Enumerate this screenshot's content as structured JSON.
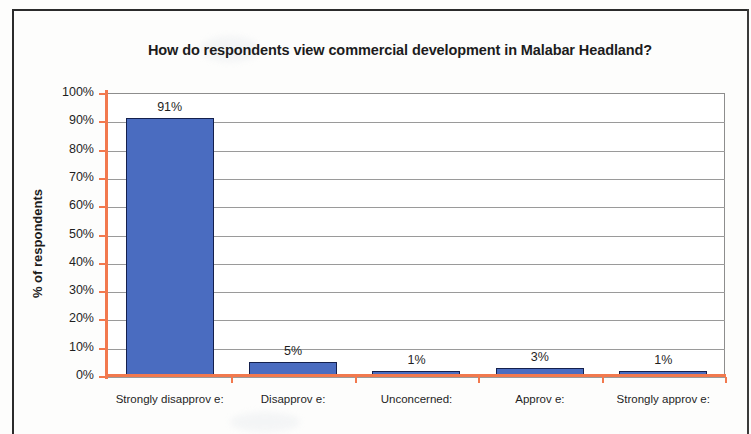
{
  "chart_data": {
    "type": "bar",
    "title": "How do respondents view commercial development in Malabar Headland?",
    "xlabel": "",
    "ylabel": "% of respondents",
    "categories": [
      "Strongly  disapprov e:",
      "Disapprov e:",
      "Unconcerned:",
      "Approv e:",
      "Strongly  approv e:"
    ],
    "values": [
      91,
      5,
      1,
      3,
      1
    ],
    "value_labels": [
      "91%",
      "5%",
      "1%",
      "3%",
      "1%"
    ],
    "ylim": [
      0,
      100
    ],
    "ytick_labels": [
      "100%",
      "90%",
      "80%",
      "70%",
      "60%",
      "50%",
      "40%",
      "30%",
      "20%",
      "10%",
      "0%"
    ],
    "ytick_values": [
      100,
      90,
      80,
      70,
      60,
      50,
      40,
      30,
      20,
      10,
      0
    ],
    "grid": true,
    "legend": false,
    "series": [
      {
        "name": "% of respondents",
        "values": [
          91,
          5,
          1,
          3,
          1
        ]
      }
    ],
    "colors": {
      "bar_fill": "#4a6cc0",
      "bar_border": "#14204d",
      "axis_line": "#f2794e",
      "gridline": "#9a9a9a",
      "plot_border": "#8d8d8d",
      "text": "#1f1f1f",
      "frame": "#2b2b2b",
      "background": "#ffffff"
    }
  }
}
